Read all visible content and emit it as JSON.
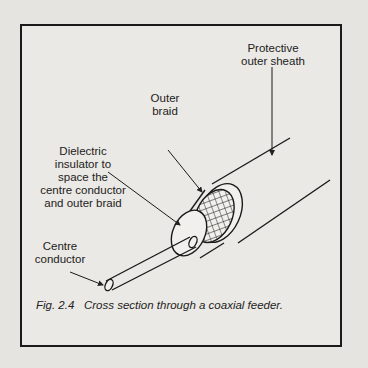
{
  "figure": {
    "labels": {
      "sheath": "Protective\nouter sheath",
      "braid": "Outer\nbraid",
      "dielectric": "Dielectric\ninsulator to\nspace the\ncentre conductor\nand outer braid",
      "conductor": "Centre\nconductor"
    },
    "caption": "Fig. 2.4   Cross section through a coaxial feeder."
  }
}
